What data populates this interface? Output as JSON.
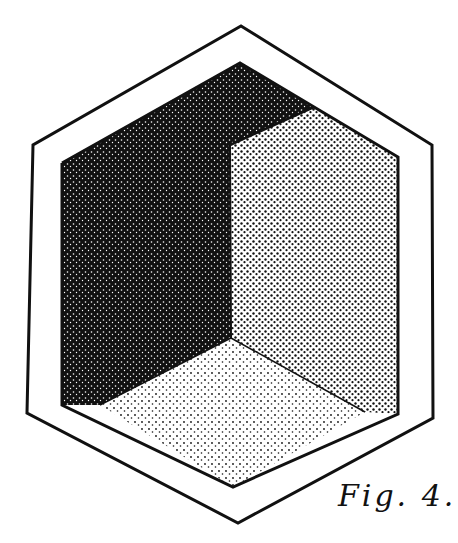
{
  "figure": {
    "caption": "Fig. 4.",
    "colors": {
      "background": "#ffffff",
      "ink": "#111111",
      "dark_face": "#1a1a1a",
      "medium_face": "#5a5a5a",
      "light_face": "#9a9a9a"
    },
    "faces": [
      {
        "name": "left-wall",
        "shade": "dark"
      },
      {
        "name": "ceiling",
        "shade": "dark"
      },
      {
        "name": "right-wall",
        "shade": "medium"
      },
      {
        "name": "floor",
        "shade": "light"
      }
    ]
  }
}
